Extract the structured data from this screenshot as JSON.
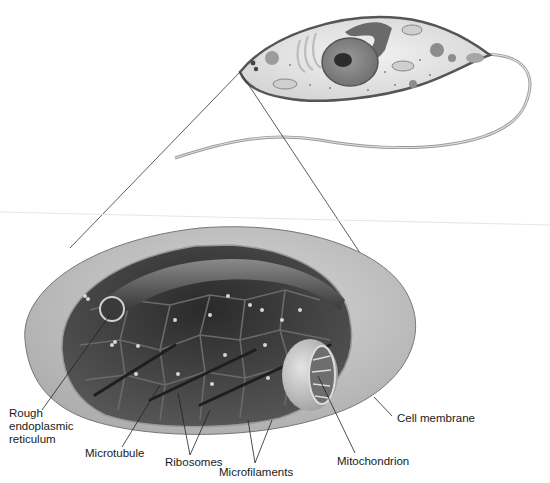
{
  "diagram": {
    "labels": {
      "rough_er": "Rough\nendoplasmic\nreticulum",
      "microtubule": "Microtubule",
      "ribosomes": "Ribosomes",
      "microfilaments": "Microfilaments",
      "mitochondrion": "Mitochondrion",
      "cell_membrane": "Cell membrane"
    },
    "colors": {
      "membrane_outer": "#c8c8c8",
      "cytoplasm_dark": "#3a3a3a",
      "cell_fill": "#e6e6e6",
      "label_text": "#1a1a1a"
    }
  }
}
